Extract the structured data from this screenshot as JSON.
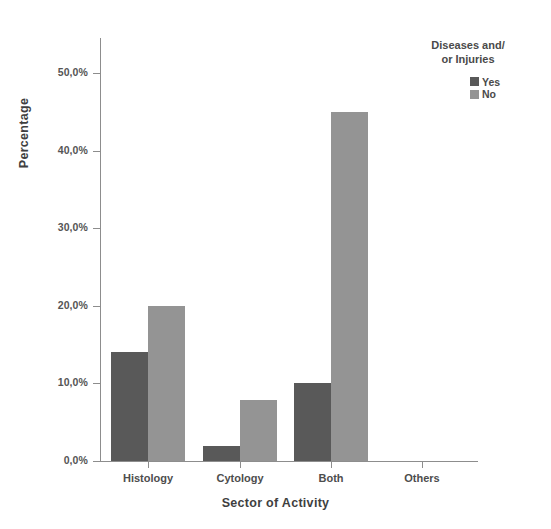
{
  "chart_data": {
    "type": "bar",
    "title": "",
    "xlabel": "Sector of Activity",
    "ylabel": "Percentage",
    "categories": [
      "Histology",
      "Cytology",
      "Both",
      "Others"
    ],
    "series": [
      {
        "name": "Yes",
        "color": "#595959",
        "values": [
          14.0,
          1.9,
          10.0,
          0.0
        ]
      },
      {
        "name": "No",
        "color": "#949494",
        "values": [
          20.0,
          7.8,
          45.0,
          0.0
        ]
      }
    ],
    "ylim": [
      0,
      55
    ],
    "ytick_values": [
      0,
      10,
      20,
      30,
      40,
      50
    ],
    "ytick_labels": [
      "0,0%",
      "10,0%",
      "20,0%",
      "30,0%",
      "40,0%",
      "50,0%"
    ],
    "grid": false,
    "legend": {
      "title": "Diseases and/\nor Injuries",
      "position": "top-right",
      "entries": [
        {
          "label": "Yes",
          "color": "#595959"
        },
        {
          "label": "No",
          "color": "#949494"
        }
      ]
    },
    "axis_color": "#8d8d8d",
    "background": "#ffffff"
  },
  "geometry": {
    "plot_left": 100,
    "plot_baseline_y": 461,
    "plot_top": 38,
    "plot_right": 478,
    "px_per_percent": 7.76,
    "group_centers": [
      148,
      240,
      331,
      422
    ],
    "bar_width": 37
  }
}
